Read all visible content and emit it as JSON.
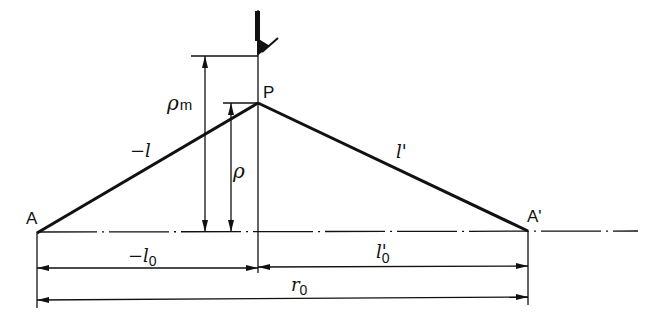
{
  "diagram": {
    "type": "optical-geometry",
    "colors": {
      "line": "#111111",
      "background": "#ffffff"
    },
    "points": {
      "A": {
        "label": "A",
        "x": 37,
        "y": 232
      },
      "A_prime": {
        "label": "A'",
        "x": 528,
        "y": 232
      },
      "P": {
        "label": "P",
        "x": 258,
        "y": 103
      },
      "tool_tip": {
        "x": 258,
        "y": 56
      }
    },
    "labels": {
      "A": "A",
      "A_prime": "A'",
      "P": "P",
      "neg_l": "−l",
      "l_prime": "l'",
      "rho_m_main": "ρ",
      "rho_m_sub": "m",
      "rho": "ρ",
      "neg_l0_main": "−l",
      "neg_l0_sub": "0",
      "l0_prime_main": "l'",
      "l0_prime_sub": "0",
      "r0_main": "r",
      "r0_sub": "0"
    },
    "dimensions": [
      {
        "name": "rho_m",
        "from": "axis",
        "to": "tool_tip"
      },
      {
        "name": "rho",
        "from": "axis",
        "to": "P"
      },
      {
        "name": "neg_l0",
        "from": "A",
        "to": "P-foot"
      },
      {
        "name": "l0_prime",
        "from": "P-foot",
        "to": "A_prime"
      },
      {
        "name": "r0",
        "from": "A",
        "to": "A_prime"
      }
    ]
  }
}
